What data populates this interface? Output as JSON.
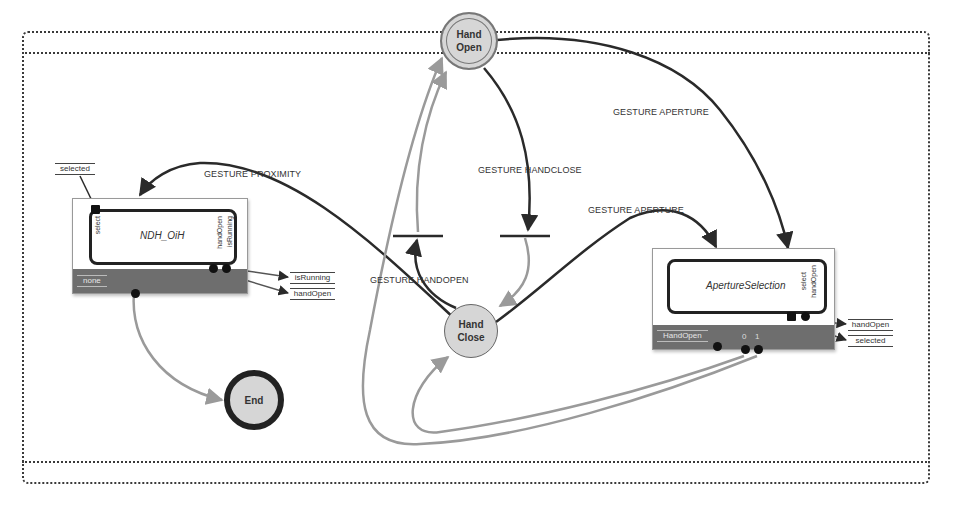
{
  "diagram": {
    "title": "Main",
    "states": {
      "hand_open": {
        "line1": "Hand",
        "line2": "Open"
      },
      "hand_close": {
        "line1": "Hand",
        "line2": "Close"
      },
      "end": {
        "label": "End"
      }
    },
    "components": {
      "ndh": {
        "name": "NDH_OiH",
        "bar_label": "none",
        "ports_left": [
          "select"
        ],
        "ports_right": [
          "handOpen",
          "isRunning"
        ]
      },
      "aperture": {
        "name": "ApertureSelection",
        "bar_label": "HandOpen",
        "ports_right": [
          "select",
          "handOpen"
        ],
        "output_indices": [
          "0",
          "1"
        ]
      }
    },
    "variables": {
      "ndh_in": "selected",
      "ndh_out": [
        "isRunning",
        "handOpen"
      ],
      "aperture_out": [
        "handOpen",
        "selected"
      ]
    },
    "transitions": {
      "proximity": "GESTURE PROXIMITY",
      "handclose": "GESTURE HANDCLOSE",
      "handopen": "GESTURE HANDOPEN",
      "aperture_from_open": "GESTURE APERTURE",
      "aperture_from_close": "GESTURE APERTURE"
    },
    "colors": {
      "edge_dark": "#2a2a2a",
      "edge_gray": "#9a9a9a",
      "state_fill": "#d6d6d6",
      "bar_fill": "#6e6e6e"
    }
  }
}
